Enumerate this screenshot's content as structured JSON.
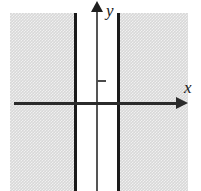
{
  "figure": {
    "type": "coordinate-plane-inequality-graph",
    "title": "",
    "axes": {
      "x_label": "x",
      "y_label": "y"
    }
  },
  "chart_data": {
    "type": "line",
    "title": "",
    "xlabel": "x",
    "ylabel": "y",
    "grid": false,
    "legend": null,
    "annotations": [],
    "axis_arrows": {
      "x": "right",
      "y": "up"
    },
    "ticks": {
      "y": [
        1
      ],
      "x": []
    },
    "boundary_lines": [
      {
        "kind": "vertical",
        "style": "solid",
        "label": ""
      },
      {
        "kind": "vertical",
        "style": "solid",
        "label": ""
      }
    ],
    "shaded_regions": [
      {
        "side": "left-of-left-boundary",
        "fill": "#d8d8d8"
      },
      {
        "side": "right-of-right-boundary",
        "fill": "#d8d8d8"
      }
    ],
    "colors": {
      "shade": "#d8d8d8",
      "boundary": "#1a1a1a",
      "x_axis": "#2b2b2b",
      "y_axis": "#555555",
      "background": "#ffffff"
    }
  }
}
